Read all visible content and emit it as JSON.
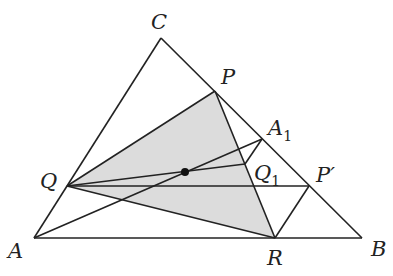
{
  "diagram": {
    "title": "",
    "points": {
      "C": {
        "label": "C",
        "x": 161,
        "y": 38
      },
      "A": {
        "label": "A",
        "x": 34,
        "y": 238
      },
      "B": {
        "label": "B",
        "x": 362,
        "y": 238
      },
      "P": {
        "label": "P",
        "x": 215,
        "y": 91
      },
      "A1": {
        "label": "A",
        "sub": "1",
        "x": 262,
        "y": 139
      },
      "Q1": {
        "label": "Q",
        "sub": "1",
        "x": 245,
        "y": 164
      },
      "Pprime": {
        "label": "P′",
        "x": 309,
        "y": 186
      },
      "Q": {
        "label": "Q",
        "x": 67,
        "y": 186
      },
      "R": {
        "label": "R",
        "x": 275,
        "y": 238
      },
      "Center": {
        "label": "",
        "x": 185,
        "y": 172
      }
    },
    "shaded_triangle": [
      "P",
      "Q",
      "R"
    ],
    "shade_color": "#dcdcdc",
    "line_color": "#222222",
    "segments": [
      [
        "A",
        "B"
      ],
      [
        "B",
        "C"
      ],
      [
        "C",
        "A"
      ],
      [
        "Q",
        "P"
      ],
      [
        "P",
        "R"
      ],
      [
        "R",
        "Q"
      ],
      [
        "A",
        "A1"
      ],
      [
        "Q",
        "Q1"
      ],
      [
        "Q",
        "Pprime"
      ],
      [
        "Q1",
        "A1"
      ],
      [
        "Pprime",
        "R"
      ]
    ]
  }
}
